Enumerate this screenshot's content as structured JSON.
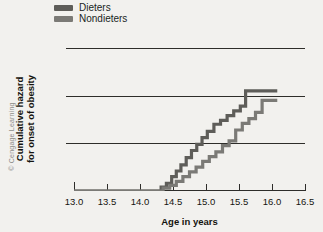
{
  "credit": "© Cengage Learning",
  "legend": {
    "position": "top-left",
    "items": [
      {
        "label": "Dieters",
        "color": "#5e5d59",
        "swatch": "legend-swatch-dieters"
      },
      {
        "label": "Nondieters",
        "color": "#7b7a76",
        "swatch": "legend-swatch-nondieters"
      }
    ]
  },
  "axes": {
    "ylabel_line1": "Cumulative hazard",
    "ylabel_line2": "for onset of obesity",
    "xlabel": "Age in years",
    "yticks": [
      "0.00",
      "0.10",
      "0.20",
      "0.30"
    ],
    "xticks": [
      "13.0",
      "13.5",
      "14.0",
      "14.5",
      "15.0",
      "15.5",
      "16.0",
      "16.5"
    ]
  },
  "chart_data": {
    "type": "line",
    "subtype": "step",
    "title": "",
    "xlabel": "Age in years",
    "ylabel": "Cumulative hazard for onset of obesity",
    "xlim": [
      13.0,
      16.5
    ],
    "ylim": [
      0.0,
      0.3
    ],
    "xticks": [
      13.0,
      13.5,
      14.0,
      14.5,
      15.0,
      15.5,
      16.0,
      16.5
    ],
    "yticks": [
      0.0,
      0.1,
      0.2,
      0.3
    ],
    "grid": "horizontal",
    "legend_position": "top-left",
    "series": [
      {
        "name": "Dieters",
        "color": "#5e5d59",
        "x": [
          13.0,
          14.25,
          14.32,
          14.4,
          14.48,
          14.55,
          14.62,
          14.7,
          14.78,
          14.86,
          14.94,
          15.02,
          15.12,
          15.22,
          15.32,
          15.42,
          15.52,
          15.6,
          16.08
        ],
        "y": [
          0.0,
          0.0,
          0.008,
          0.016,
          0.03,
          0.042,
          0.055,
          0.07,
          0.085,
          0.098,
          0.112,
          0.125,
          0.14,
          0.148,
          0.158,
          0.168,
          0.178,
          0.21,
          0.21
        ]
      },
      {
        "name": "Nondieters",
        "color": "#7b7a76",
        "x": [
          13.0,
          14.25,
          14.35,
          14.45,
          14.55,
          14.65,
          14.75,
          14.85,
          14.95,
          15.05,
          15.15,
          15.25,
          15.35,
          15.45,
          15.55,
          15.65,
          15.75,
          15.85,
          16.08
        ],
        "y": [
          0.0,
          0.0,
          0.006,
          0.012,
          0.02,
          0.03,
          0.04,
          0.05,
          0.062,
          0.072,
          0.082,
          0.095,
          0.105,
          0.128,
          0.142,
          0.152,
          0.165,
          0.19,
          0.19
        ]
      }
    ]
  }
}
